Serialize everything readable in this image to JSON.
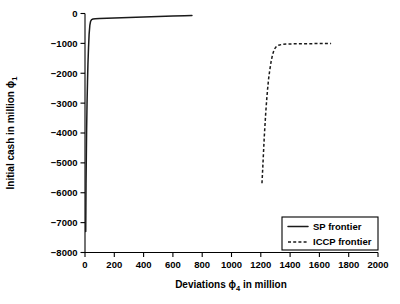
{
  "chart_data": {
    "type": "line",
    "title": "",
    "xlabel": "Deviations ϕ₄ in million",
    "xlabel_parts": {
      "pre": "Deviations ",
      "symbol": "ϕ",
      "sub": "4",
      "post": " in million"
    },
    "ylabel": "Initial cash in million ϕ₁",
    "ylabel_parts": {
      "pre": "Initial cash in million ",
      "symbol": "ϕ",
      "sub": "1",
      "post": ""
    },
    "xlim": [
      0,
      2000
    ],
    "ylim": [
      -8000,
      0
    ],
    "xticks": [
      0,
      200,
      400,
      600,
      800,
      1000,
      1200,
      1400,
      1600,
      1800,
      2000
    ],
    "xtick_labels": [
      "0",
      "200",
      "400",
      "600",
      "800",
      "1000",
      "1200",
      "1400",
      "1600",
      "1800",
      "2000"
    ],
    "yticks": [
      -8000,
      -7000,
      -6000,
      -5000,
      -4000,
      -3000,
      -2000,
      -1000,
      0
    ],
    "ytick_labels": [
      "−8000",
      "−7000",
      "−6000",
      "−5000",
      "−4000",
      "−3000",
      "−2000",
      "−1000",
      "0"
    ],
    "grid": false,
    "legend_position": "lower right",
    "series": [
      {
        "name": "SP frontier",
        "style": "solid",
        "color": "#1a1a1a",
        "points": [
          [
            5,
            -7295
          ],
          [
            6,
            -6500
          ],
          [
            7,
            -5700
          ],
          [
            9,
            -4800
          ],
          [
            11,
            -3900
          ],
          [
            14,
            -3000
          ],
          [
            17,
            -2300
          ],
          [
            20,
            -1700
          ],
          [
            24,
            -1150
          ],
          [
            28,
            -700
          ],
          [
            33,
            -400
          ],
          [
            38,
            -260
          ],
          [
            45,
            -205
          ],
          [
            55,
            -185
          ],
          [
            70,
            -176
          ],
          [
            100,
            -168
          ],
          [
            150,
            -157
          ],
          [
            200,
            -148
          ],
          [
            300,
            -130
          ],
          [
            400,
            -114
          ],
          [
            500,
            -99
          ],
          [
            600,
            -85
          ],
          [
            680,
            -76
          ],
          [
            730,
            -70
          ]
        ]
      },
      {
        "name": "ICCP frontier",
        "style": "dashed",
        "color": "#1a1a1a",
        "points": [
          [
            1208,
            -5680
          ],
          [
            1212,
            -5300
          ],
          [
            1216,
            -4900
          ],
          [
            1220,
            -4500
          ],
          [
            1224,
            -4100
          ],
          [
            1229,
            -3700
          ],
          [
            1234,
            -3300
          ],
          [
            1240,
            -2900
          ],
          [
            1246,
            -2550
          ],
          [
            1253,
            -2200
          ],
          [
            1261,
            -1900
          ],
          [
            1270,
            -1620
          ],
          [
            1280,
            -1380
          ],
          [
            1292,
            -1200
          ],
          [
            1306,
            -1105
          ],
          [
            1322,
            -1060
          ],
          [
            1345,
            -1035
          ],
          [
            1380,
            -1022
          ],
          [
            1430,
            -1015
          ],
          [
            1500,
            -1010
          ],
          [
            1580,
            -1008
          ],
          [
            1680,
            -1005
          ]
        ]
      }
    ],
    "legend": [
      {
        "label": "SP frontier",
        "style": "solid"
      },
      {
        "label": "ICCP frontier",
        "style": "dashed"
      }
    ]
  }
}
